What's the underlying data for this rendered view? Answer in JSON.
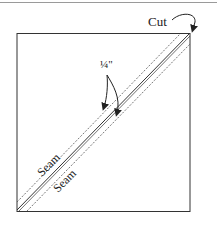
{
  "diagram": {
    "labels": {
      "cut": "Cut",
      "quarter_inch": "¼\"",
      "seam_upper": "Seam",
      "seam_lower": "Seam"
    },
    "colors": {
      "line": "#333333",
      "dashed": "#555555",
      "rule": "#9a9a9a"
    }
  }
}
